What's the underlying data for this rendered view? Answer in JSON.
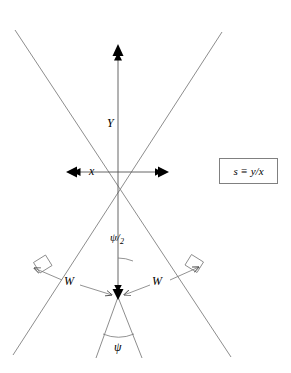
{
  "figure": {
    "type": "line-diagram",
    "background_color": "#ffffff",
    "line_color": "#777777",
    "arrow_color": "#000000",
    "box_border_color": "#808080"
  },
  "labels": {
    "vertical_distance": "Y",
    "horizontal_distance": "x",
    "half_angle": "ψ",
    "half_angle_subscript": "2",
    "opening_angle": "ψ",
    "width_left": "W",
    "width_right": "W"
  },
  "formula": {
    "text": "s ≡ y/x"
  },
  "geometry": {
    "top_apex": {
      "x": 118,
      "y": 47
    },
    "bottom_vertex": {
      "x": 118,
      "y": 297
    },
    "left_intersection": {
      "x": 68,
      "y": 172
    },
    "right_intersection": {
      "x": 167,
      "y": 172
    },
    "lines": [
      {
        "name": "outer-left-to-right",
        "x1": 15,
        "y1": 30,
        "x2": 231,
        "y2": 357
      },
      {
        "name": "outer-right-to-left",
        "x1": 222,
        "y1": 32,
        "x2": 13,
        "y2": 355
      },
      {
        "name": "inner-left",
        "x1": 118,
        "y1": 297,
        "x2": 96,
        "y2": 357
      },
      {
        "name": "inner-right",
        "x1": 118,
        "y1": 297,
        "x2": 142,
        "y2": 357
      }
    ],
    "y_arrow": {
      "x": 118,
      "y_from": 297,
      "y_to": 47
    },
    "x_arrow": {
      "y": 172,
      "x_from": 68,
      "x_to": 167
    },
    "right_angle_marks": [
      {
        "name": "left-perpendicular",
        "x": 40,
        "y": 265
      },
      {
        "name": "right-perpendicular",
        "x": 196,
        "y": 265
      }
    ],
    "angle_arcs": [
      {
        "name": "half-angle-arc",
        "cx": 118,
        "cy": 297,
        "r": 38
      },
      {
        "name": "full-angle-arc",
        "cx": 118,
        "cy": 297,
        "r": 40
      }
    ]
  }
}
